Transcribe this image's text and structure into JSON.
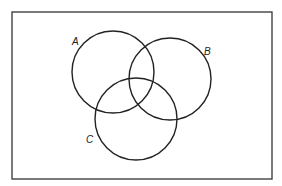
{
  "diagram": {
    "type": "venn",
    "universe": {
      "x": 12,
      "y": 12,
      "width": 260,
      "height": 167
    },
    "stroke_color": "#222222",
    "sets": [
      {
        "name": "A",
        "cx": 113,
        "cy": 72,
        "r": 41,
        "label_x": 72,
        "label_y": 45
      },
      {
        "name": "B",
        "cx": 170,
        "cy": 79,
        "r": 41,
        "label_x": 204,
        "label_y": 55
      },
      {
        "name": "C",
        "cx": 136,
        "cy": 119,
        "r": 41,
        "label_x": 86,
        "label_y": 143
      }
    ]
  }
}
